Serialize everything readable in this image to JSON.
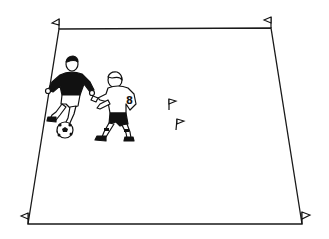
{
  "diagram": {
    "type": "soccer-drill-field",
    "field": {
      "corners": {
        "top_left": [
          59,
          29
        ],
        "top_right": [
          271,
          28
        ],
        "bottom_right": [
          302,
          224
        ],
        "bottom_left": [
          28,
          224
        ]
      },
      "line_color": "#1a1a1a"
    },
    "corner_flags": [
      {
        "id": "flag-top-left",
        "x": 59,
        "y": 29
      },
      {
        "id": "flag-top-right",
        "x": 271,
        "y": 28
      },
      {
        "id": "flag-bottom-left",
        "x": 28,
        "y": 224
      },
      {
        "id": "flag-bottom-right",
        "x": 302,
        "y": 224
      }
    ],
    "cone_flags": [
      {
        "id": "flag-mid-1",
        "x": 170,
        "y": 108
      },
      {
        "id": "flag-mid-2",
        "x": 177,
        "y": 128
      }
    ],
    "players": [
      {
        "id": "attacker",
        "shirt": "dark",
        "has_ball": true
      },
      {
        "id": "defender",
        "shirt": "white",
        "number": "8"
      }
    ],
    "ball": {
      "x": 65,
      "y": 130,
      "r": 8
    },
    "colors": {
      "ink": "#111111",
      "paper": "#ffffff"
    }
  }
}
